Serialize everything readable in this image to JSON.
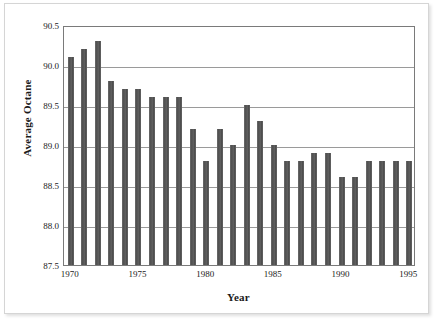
{
  "chart_data": {
    "type": "bar",
    "title": "",
    "xlabel": "Year",
    "ylabel": "Average Octane",
    "categories": [
      "1970",
      "1971",
      "1972",
      "1973",
      "1974",
      "1975",
      "1976",
      "1977",
      "1978",
      "1979",
      "1980",
      "1981",
      "1982",
      "1983",
      "1984",
      "1985",
      "1986",
      "1987",
      "1988",
      "1989",
      "1990",
      "1991",
      "1992",
      "1993",
      "1994",
      "1995"
    ],
    "values": [
      90.1,
      90.2,
      90.3,
      89.8,
      89.7,
      89.7,
      89.6,
      89.6,
      89.6,
      89.2,
      88.8,
      89.2,
      89.0,
      89.5,
      89.3,
      89.0,
      88.8,
      88.8,
      88.9,
      88.9,
      88.6,
      88.6,
      88.8,
      88.8,
      88.8,
      88.8
    ],
    "ylim": [
      87.5,
      90.5
    ],
    "yticks": [
      "87.5",
      "88.0",
      "88.5",
      "89.0",
      "89.5",
      "90.0",
      "90.5"
    ],
    "ytick_values": [
      87.5,
      88.0,
      88.5,
      89.0,
      89.5,
      90.0,
      90.5
    ],
    "xtick_labels": [
      "1970",
      "1975",
      "1980",
      "1985",
      "1990",
      "1995"
    ],
    "xtick_values": [
      1970,
      1975,
      1980,
      1985,
      1990,
      1995
    ],
    "xlim": [
      1969.5,
      1995.5
    ],
    "grid": true,
    "legend": false,
    "legend_position": "none",
    "series_color": "#5a5a5a",
    "gridline_color": "#9a9a9a",
    "plot_border_color": "#7a7a7a",
    "background_color": "#ffffff"
  }
}
